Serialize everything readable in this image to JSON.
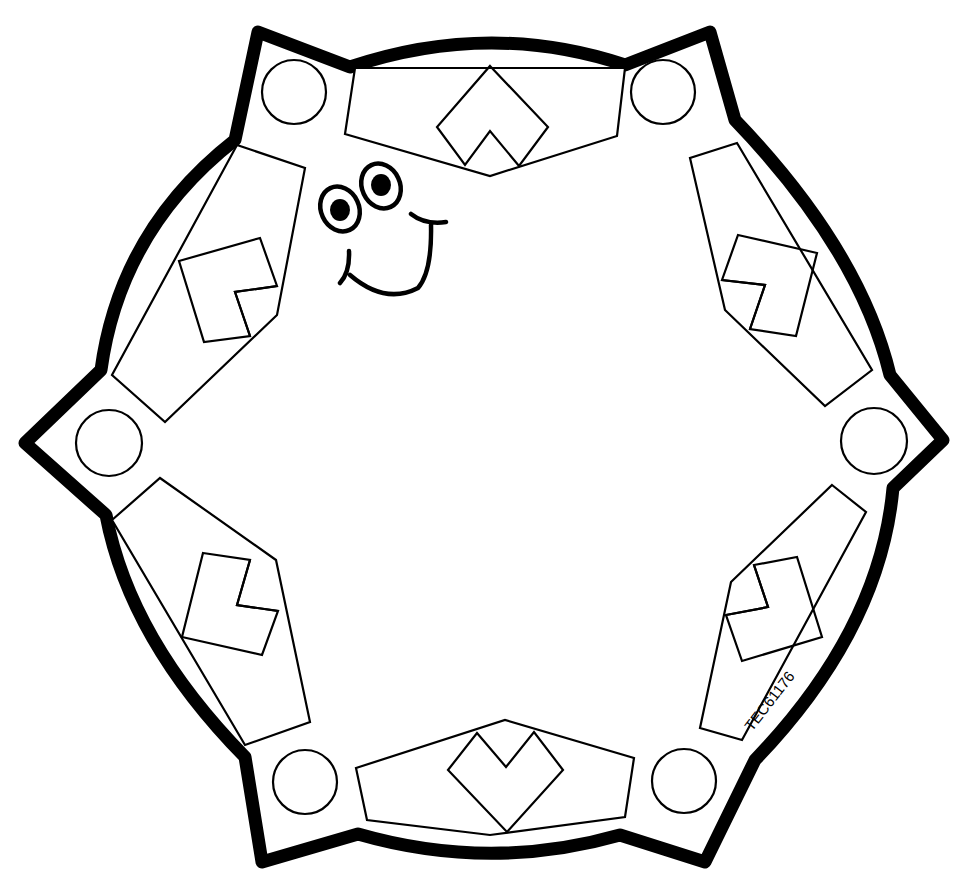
{
  "artwork": {
    "type": "printable craft cut-out pattern",
    "description": "Hexagonal gear-like badge with six circle tabs, six panels with square/chevron motifs and a smiling face",
    "stroke_color": "#000000",
    "fill_color": "#ffffff"
  },
  "product_code": "TEC61176",
  "circles": [
    {
      "name": "top-left",
      "cx": 294,
      "cy": 92
    },
    {
      "name": "top-right",
      "cx": 663,
      "cy": 92
    },
    {
      "name": "left",
      "cx": 109,
      "cy": 443
    },
    {
      "name": "right",
      "cx": 874,
      "cy": 441
    },
    {
      "name": "bottom-left",
      "cx": 305,
      "cy": 782
    },
    {
      "name": "bottom-right",
      "cx": 684,
      "cy": 781
    }
  ],
  "panels": [
    "top",
    "upper-left",
    "upper-right",
    "lower-left",
    "lower-right",
    "bottom"
  ],
  "face": {
    "eyes": 2,
    "expression": "smile"
  }
}
